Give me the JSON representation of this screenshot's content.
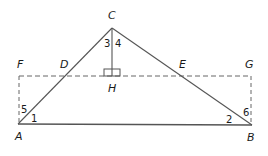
{
  "diagram": {
    "type": "geometry",
    "colors": {
      "stroke": "#555555",
      "dashed": "#666666",
      "text": "#1a1a1a"
    },
    "points": {
      "A": {
        "label": "A",
        "x": 18,
        "y": 124
      },
      "B": {
        "label": "B",
        "x": 252,
        "y": 125
      },
      "C": {
        "label": "C",
        "x": 112,
        "y": 28
      },
      "D": {
        "label": "D",
        "x": 65,
        "y": 76
      },
      "E": {
        "label": "E",
        "x": 160,
        "y": 76
      },
      "F": {
        "label": "F",
        "x": 19,
        "y": 76
      },
      "G": {
        "label": "G",
        "x": 251,
        "y": 76
      },
      "H": {
        "label": "H",
        "x": 112,
        "y": 76
      }
    },
    "angle_labels": [
      "1",
      "2",
      "3",
      "4",
      "5",
      "6"
    ],
    "segments": [
      {
        "from": "A",
        "to": "B",
        "style": "solid"
      },
      {
        "from": "A",
        "to": "C",
        "style": "solid"
      },
      {
        "from": "B",
        "to": "C",
        "style": "solid"
      },
      {
        "from": "C",
        "to": "H",
        "style": "solid"
      },
      {
        "from": "F",
        "to": "G",
        "style": "dashed"
      },
      {
        "from": "F",
        "to": "A",
        "style": "dashed"
      },
      {
        "from": "G",
        "to": "B",
        "style": "dashed"
      }
    ],
    "right_angle_at": "H"
  }
}
